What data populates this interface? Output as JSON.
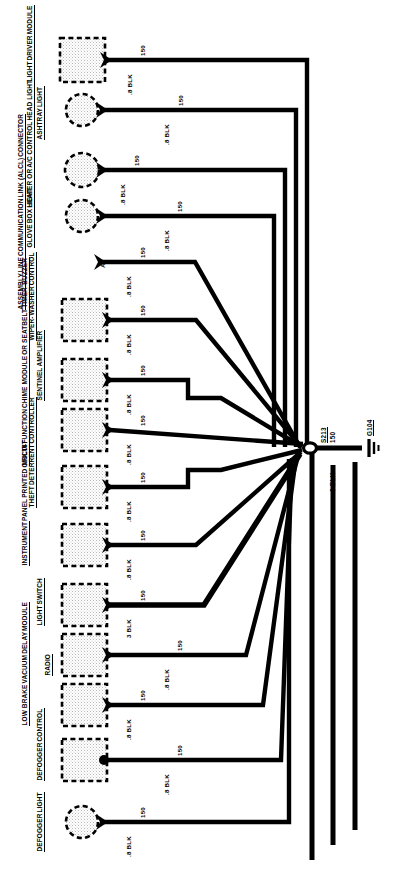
{
  "diagram": {
    "orientation": "rotated-90",
    "ground_node": {
      "splice_id": "S213",
      "splice_circuit": "150",
      "trunk_wire": "3 BLK",
      "ground_id": "G104",
      "ground_icon": "chassis-ground-icon"
    },
    "components": [
      {
        "id": "light-driver-module",
        "symbol": "box",
        "label_lines": [
          "LIGHT",
          "DRIVER",
          "MODULE"
        ],
        "underline": [
          true,
          true,
          true
        ],
        "wire_gauge_color": ".8 BLK",
        "circuit": "150",
        "pin": ""
      },
      {
        "id": "ashtray-light",
        "symbol": "lamp",
        "label_lines": [
          "ASHTRAY",
          "LIGHT"
        ],
        "underline": [
          true,
          true
        ],
        "wire_gauge_color": ".8 BLK",
        "circuit": "150",
        "pin": ""
      },
      {
        "id": "heater-ac-control-head-light",
        "symbol": "lamp",
        "label_lines": [
          "HEATER OR",
          "A/C CONTROL",
          "HEAD LIGHT"
        ],
        "underline": [
          true,
          true,
          true
        ],
        "wire_gauge_color": ".8 BLK",
        "circuit": "150",
        "pin": ""
      },
      {
        "id": "glove-box-light",
        "symbol": "lamp",
        "label_lines": [
          "GLOVE",
          "BOX",
          "LIGHT"
        ],
        "underline": [
          true,
          true,
          true
        ],
        "wire_gauge_color": ".8 BLK",
        "circuit": "150",
        "pin": ""
      },
      {
        "id": "alcl-connector",
        "symbol": "terminal",
        "label_lines": [
          "ASSEMBLY",
          "LINE",
          "COMMUNICATION",
          "LINK (ALCL)",
          "CONNECTOR"
        ],
        "underline": [
          true,
          true,
          true,
          true,
          true
        ],
        "wire_gauge_color": ".8 BLK",
        "circuit": "150",
        "pin": "A"
      },
      {
        "id": "wiper-washer-control",
        "symbol": "box",
        "label_lines": [
          "WIPER-",
          "WASHER",
          "CONTROL"
        ],
        "underline": [
          true,
          true,
          true
        ],
        "wire_gauge_color": ".8 BLK",
        "circuit": "150",
        "pin": ""
      },
      {
        "id": "sentinel-amplifier",
        "symbol": "box",
        "label_lines": [
          "SENTINEL",
          "AMPLIFIER"
        ],
        "underline": [
          true,
          true
        ],
        "wire_gauge_color": ".8 BLK",
        "circuit": "150",
        "pin": ""
      },
      {
        "id": "multi-function-chime-module",
        "symbol": "box",
        "label_lines": [
          "MULTI-FUNCTION",
          "CHIME MODULE",
          "OR SEATBELT",
          "TIMER-BUZZER"
        ],
        "underline": [
          true,
          true,
          true,
          true
        ],
        "wire_gauge_color": ".8 BLK",
        "circuit": "150",
        "pin": ""
      },
      {
        "id": "theft-deterrent-controller",
        "symbol": "box",
        "label_lines": [
          "THEFT",
          "DETERRENT",
          "CONTROLLER"
        ],
        "underline": [
          true,
          true,
          true
        ],
        "wire_gauge_color": ".8 BLK",
        "circuit": "150",
        "pin": ""
      },
      {
        "id": "instrument-panel-printed-circuit",
        "symbol": "box",
        "label_lines": [
          "INSTRUMENT",
          "PANEL",
          "PRINTED",
          "CIRCUIT"
        ],
        "underline": [
          true,
          false,
          false,
          false
        ],
        "wire_gauge_color": ".8 BLK",
        "circuit": "150",
        "pin": ""
      },
      {
        "id": "light-switch",
        "symbol": "box",
        "label_lines": [
          "LIGHT",
          "SWITCH"
        ],
        "underline": [
          true,
          true
        ],
        "wire_gauge_color": "3 BLK",
        "circuit": "150",
        "pin": ""
      },
      {
        "id": "radio",
        "symbol": "box",
        "label_lines": [
          "RADIO"
        ],
        "underline": [
          true
        ],
        "wire_gauge_color": ".8 BLK",
        "circuit": "150",
        "pin": ""
      },
      {
        "id": "low-brake-vacuum-delay-module",
        "symbol": "box",
        "label_lines": [
          "LOW BRAKE",
          "VACUUM",
          "DELAY",
          "MODULE"
        ],
        "underline": [
          true,
          true,
          true,
          true
        ],
        "wire_gauge_color": ".8 BLK",
        "circuit": "150",
        "pin": ""
      },
      {
        "id": "defogger-control",
        "symbol": "box",
        "label_lines": [
          "DEFOGGER",
          "CONTROL"
        ],
        "underline": [
          true,
          true
        ],
        "wire_gauge_color": ".8 BLK",
        "circuit": "150",
        "pin": ""
      },
      {
        "id": "defogger-light",
        "symbol": "lamp",
        "label_lines": [
          "DEFOGGER",
          "LIGHT"
        ],
        "underline": [
          true,
          true
        ],
        "wire_gauge_color": ".8 BLK",
        "circuit": "150",
        "pin": ""
      }
    ]
  }
}
